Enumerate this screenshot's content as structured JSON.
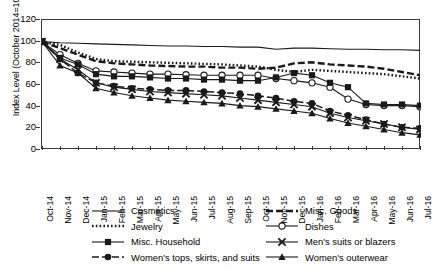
{
  "chart_data": {
    "type": "line",
    "title": "",
    "xlabel": "",
    "ylabel": "Index Level (October 2014=100)",
    "ylim": [
      0,
      120
    ],
    "yticks": [
      0,
      20,
      40,
      60,
      80,
      100,
      120
    ],
    "grid": false,
    "legend_position": "bottom",
    "x": [
      "Oct-14",
      "Nov-14",
      "Dec-14",
      "Jan-15",
      "Feb-15",
      "Mar-15",
      "Apr-15",
      "May-15",
      "Jun-15",
      "Jul-15",
      "Aug-15",
      "Sep-15",
      "Oct-15",
      "Nov-15",
      "Dec-15",
      "Jan-16",
      "Feb-16",
      "Mar-16",
      "Apr-16",
      "May-16",
      "Jun-16",
      "Jul-16"
    ],
    "series": [
      {
        "name": "Cosmetics",
        "style": "solid",
        "marker": "none",
        "color": "#1a1a1a",
        "values": [
          100,
          99,
          98.5,
          98,
          97.5,
          97,
          96.5,
          96,
          96,
          95.5,
          95.5,
          95,
          95,
          93,
          94,
          94,
          93.5,
          93,
          93,
          92.5,
          92.5,
          92
        ]
      },
      {
        "name": "Misc. Goods",
        "style": "dashed",
        "marker": "none",
        "color": "#1a1a1a",
        "values": [
          100,
          94,
          88,
          82,
          80,
          79,
          78,
          77.5,
          77,
          77,
          76,
          76,
          75,
          76,
          80,
          81,
          79,
          78,
          77,
          75,
          72,
          69
        ]
      },
      {
        "name": "Jewelry",
        "style": "dotted",
        "marker": "none",
        "color": "#1a1a1a",
        "values": [
          100,
          97,
          90,
          84,
          82,
          81.5,
          81,
          80.5,
          80,
          79.5,
          79,
          78,
          77,
          74,
          72,
          74,
          73,
          72,
          71,
          70,
          68,
          66
        ]
      },
      {
        "name": "Dishes",
        "style": "solid",
        "marker": "open-circle",
        "color": "#1a1a1a",
        "values": [
          100,
          88,
          80,
          73,
          72,
          71,
          70,
          70,
          69.5,
          69,
          69,
          69,
          69,
          66,
          64,
          62,
          58,
          47,
          42,
          41,
          41,
          40
        ]
      },
      {
        "name": "Misc. Household",
        "style": "solid",
        "marker": "filled-square",
        "color": "#1a1a1a",
        "values": [
          100,
          85,
          79,
          70,
          68,
          68,
          67,
          66,
          66,
          65,
          65,
          64,
          64,
          67,
          71,
          69,
          62,
          58,
          43,
          42,
          42,
          41
        ]
      },
      {
        "name": "Men's suits or blazers",
        "style": "solid",
        "marker": "cross-x",
        "color": "#1a1a1a",
        "values": [
          100,
          84,
          74,
          62,
          58,
          56,
          54,
          53,
          52,
          51,
          50,
          48,
          46,
          44,
          42,
          40,
          34,
          30,
          27,
          24,
          21,
          19
        ]
      },
      {
        "name": "Women's tops, skirts, and suits",
        "style": "dashed",
        "marker": "filled-circle",
        "color": "#1a1a1a",
        "values": [
          100,
          84,
          71,
          62,
          59,
          57,
          56,
          55,
          55,
          54,
          53,
          52,
          50,
          48,
          45,
          43,
          36,
          32,
          28,
          24,
          21,
          20
        ]
      },
      {
        "name": "Women's outerwear",
        "style": "solid",
        "marker": "filled-triangle",
        "color": "#1a1a1a",
        "values": [
          100,
          78,
          71,
          57,
          53,
          50,
          48,
          46,
          45,
          44,
          43,
          41,
          40,
          38,
          36,
          34,
          29,
          25,
          22,
          19,
          16,
          14
        ]
      }
    ]
  }
}
